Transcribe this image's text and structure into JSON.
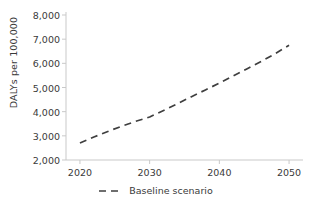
{
  "chart_data": {
    "type": "line",
    "title": "",
    "xlabel": "",
    "ylabel": "DALYs per 100,000",
    "xlim": [
      2018,
      2052
    ],
    "ylim": [
      2000,
      8000
    ],
    "grid": false,
    "legend_position": "bottom-center",
    "x_ticks": [
      "2020",
      "2030",
      "2040",
      "2050"
    ],
    "x_tick_values": [
      2020,
      2030,
      2040,
      2050
    ],
    "y_ticks": [
      "2,000",
      "3,000",
      "4,000",
      "5,000",
      "6,000",
      "7,000",
      "8,000"
    ],
    "y_tick_values": [
      2000,
      3000,
      4000,
      5000,
      6000,
      7000,
      8000
    ],
    "series": [
      {
        "name": "Baseline scenario",
        "style": "dashed",
        "color": "#3f3f3f",
        "x": [
          2020,
          2022,
          2024,
          2026,
          2028,
          2030,
          2032,
          2034,
          2036,
          2038,
          2040,
          2042,
          2044,
          2046,
          2048,
          2050
        ],
        "values": [
          2700,
          2950,
          3180,
          3400,
          3600,
          3780,
          4050,
          4330,
          4620,
          4900,
          5180,
          5480,
          5780,
          6080,
          6400,
          6750
        ]
      }
    ]
  },
  "legend": {
    "entries": [
      {
        "label": "Baseline scenario",
        "marker": "dashed-line-icon",
        "color": "#3f3f3f"
      }
    ]
  },
  "axis": {
    "line_color": "#c9c9c9",
    "tick_color": "#c9c9c9",
    "text_color": "#3a3a3a"
  }
}
